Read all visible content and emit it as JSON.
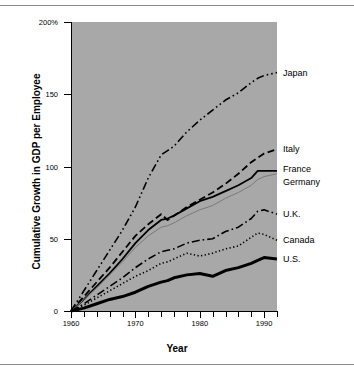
{
  "chart_data": {
    "type": "line",
    "title": "",
    "xlabel": "Year",
    "ylabel": "Cumulative Growth in GDP per Employee",
    "xlim": [
      1960,
      1992
    ],
    "ylim": [
      0,
      200
    ],
    "grid": false,
    "legend_position": "right-inline",
    "y_ticks": [
      {
        "value": 0,
        "label": "0"
      },
      {
        "value": 50,
        "label": "50"
      },
      {
        "value": 100,
        "label": "100"
      },
      {
        "value": 150,
        "label": "150"
      },
      {
        "value": 200,
        "label": "200%"
      }
    ],
    "x_ticks_major": [
      {
        "value": 1960,
        "label": "1960"
      },
      {
        "value": 1970,
        "label": "1970"
      },
      {
        "value": 1980,
        "label": "1980"
      },
      {
        "value": 1990,
        "label": "1990"
      }
    ],
    "x_ticks_minor": [
      1962,
      1964,
      1966,
      1968,
      1972,
      1974,
      1976,
      1978,
      1982,
      1984,
      1986,
      1988,
      1992
    ],
    "x": [
      1960,
      1962,
      1964,
      1966,
      1968,
      1970,
      1972,
      1974,
      1975,
      1976,
      1978,
      1980,
      1982,
      1984,
      1986,
      1988,
      1989,
      1990,
      1992
    ],
    "series": [
      {
        "name": "Japan",
        "label": "Japan",
        "style": "dash-dot-dot",
        "color": "#000000",
        "width": 1.6,
        "label_y": 165,
        "values": [
          0,
          14,
          28,
          42,
          56,
          72,
          92,
          108,
          111,
          114,
          124,
          132,
          139,
          146,
          151,
          158,
          161,
          163,
          165
        ]
      },
      {
        "name": "Italy",
        "label": "Italy",
        "style": "dashed",
        "color": "#000000",
        "width": 1.8,
        "label_y": 112,
        "values": [
          0,
          10,
          20,
          30,
          41,
          52,
          60,
          67,
          63,
          66,
          72,
          77,
          82,
          88,
          95,
          103,
          106,
          109,
          112
        ]
      },
      {
        "name": "France",
        "label": "France",
        "style": "solid",
        "color": "#000000",
        "width": 1.8,
        "label_y": 98,
        "values": [
          0,
          8,
          17,
          26,
          36,
          47,
          56,
          63,
          64,
          66,
          71,
          76,
          79,
          83,
          87,
          92,
          97,
          97,
          97
        ]
      },
      {
        "name": "Germany",
        "label": "Germany",
        "style": "solid-thin",
        "color": "#7a7a7a",
        "width": 1.0,
        "label_y": 89,
        "values": [
          0,
          8,
          16,
          25,
          34,
          44,
          52,
          58,
          59,
          61,
          66,
          70,
          73,
          78,
          82,
          87,
          91,
          93,
          95
        ]
      },
      {
        "name": "U.K.",
        "label": "U.K.",
        "style": "dash-dot",
        "color": "#000000",
        "width": 1.6,
        "label_y": 67,
        "values": [
          0,
          5,
          11,
          17,
          23,
          30,
          36,
          41,
          42,
          43,
          47,
          49,
          50,
          55,
          58,
          64,
          69,
          70,
          67
        ]
      },
      {
        "name": "Canada",
        "label": "Canada",
        "style": "dotted",
        "color": "#000000",
        "width": 1.6,
        "label_y": 49,
        "values": [
          0,
          4,
          9,
          14,
          19,
          24,
          28,
          33,
          34,
          36,
          40,
          38,
          40,
          43,
          45,
          51,
          54,
          53,
          49
        ]
      },
      {
        "name": "U.S.",
        "label": "U.S.",
        "style": "solid-thick",
        "color": "#000000",
        "width": 3.0,
        "label_y": 36,
        "values": [
          0,
          2,
          5,
          8,
          10,
          13,
          17,
          20,
          21,
          23,
          25,
          26,
          24,
          28,
          30,
          33,
          35,
          37,
          36
        ]
      }
    ]
  }
}
